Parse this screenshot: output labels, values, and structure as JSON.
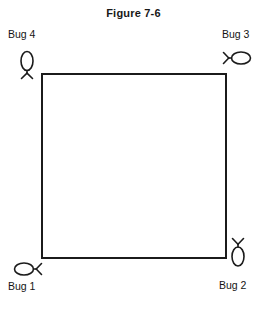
{
  "figure": {
    "title": "Figure 7-6",
    "shape": {
      "name": "square",
      "stroke_color": "#1b1b1b",
      "fill_color": "#ffffff",
      "stroke_width_px": 2,
      "x": 41,
      "y": 73,
      "width": 182,
      "height": 182
    },
    "background_color": "#ffffff",
    "text_color": "#141414",
    "bugs": [
      {
        "id": "bug-1",
        "label": "Bug 1",
        "corner": "bottom-left",
        "icon": "bug-horizontal-legs-right-icon",
        "orientation": "horizontal",
        "legs_side": "right",
        "label_position": "below"
      },
      {
        "id": "bug-2",
        "label": "Bug 2",
        "corner": "bottom-right",
        "icon": "bug-vertical-legs-up-icon",
        "orientation": "vertical",
        "legs_side": "top",
        "label_position": "below"
      },
      {
        "id": "bug-3",
        "label": "Bug 3",
        "corner": "top-right",
        "icon": "bug-horizontal-legs-left-icon",
        "orientation": "horizontal",
        "legs_side": "left",
        "label_position": "above"
      },
      {
        "id": "bug-4",
        "label": "Bug 4",
        "corner": "top-left",
        "icon": "bug-vertical-legs-down-icon",
        "orientation": "vertical",
        "legs_side": "bottom",
        "label_position": "above"
      }
    ]
  }
}
